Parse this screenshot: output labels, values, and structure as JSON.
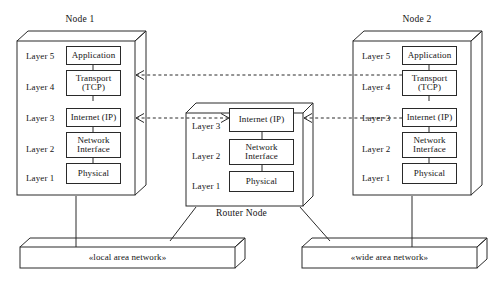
{
  "diagram": {
    "nodes": [
      {
        "id": "node1",
        "title": "Node 1",
        "layers": [
          {
            "label": "Layer 5",
            "protocol": "Application"
          },
          {
            "label": "Layer 4",
            "protocol": "Transport\n(TCP)"
          },
          {
            "label": "Layer 3",
            "protocol": "Internet (IP)"
          },
          {
            "label": "Layer 2",
            "protocol": "Network\nInterface"
          },
          {
            "label": "Layer 1",
            "protocol": "Physical"
          }
        ]
      },
      {
        "id": "router",
        "title": "Router Node",
        "layers": [
          {
            "label": "Layer 3",
            "protocol": "Internet (IP)"
          },
          {
            "label": "Layer 2",
            "protocol": "Network\nInterface"
          },
          {
            "label": "Layer 1",
            "protocol": "Physical"
          }
        ]
      },
      {
        "id": "node2",
        "title": "Node 2",
        "layers": [
          {
            "label": "Layer 5",
            "protocol": "Application"
          },
          {
            "label": "Layer 4",
            "protocol": "Transport\n(TCP)"
          },
          {
            "label": "Layer 3",
            "protocol": "Internet (IP)"
          },
          {
            "label": "Layer 2",
            "protocol": "Network\nInterface"
          },
          {
            "label": "Layer 1",
            "protocol": "Physical"
          }
        ]
      }
    ],
    "networks": [
      {
        "id": "lan",
        "label": "«local area network»"
      },
      {
        "id": "wan",
        "label": "«wide area network»"
      }
    ],
    "associations": [
      {
        "from": "node1.layer4",
        "to": "node2.layer4",
        "style": "dashed",
        "arrows": "both"
      },
      {
        "from": "node1.layer3",
        "to": "router.layer3",
        "style": "dashed",
        "arrows": "both"
      },
      {
        "from": "router.layer3",
        "to": "node2.layer3",
        "style": "dashed",
        "arrows": "both"
      }
    ],
    "colors": {
      "stroke": "#2a2a2a",
      "text": "#141414",
      "background": "#ffffff"
    }
  }
}
